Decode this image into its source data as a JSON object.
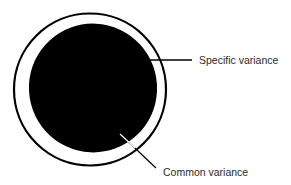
{
  "diagram": {
    "type": "variance-decomposition",
    "shapes": {
      "total_variance_circle": {
        "cx": 90,
        "cy": 89.5,
        "r": 76,
        "stroke": "#000000",
        "stroke_width": 2.2,
        "fill": "none"
      },
      "common_variance_ellipse": {
        "cx": 93,
        "cy": 88,
        "rx": 64,
        "ry": 64,
        "fill": "#000000"
      }
    },
    "labels": {
      "specific": "Specific variance",
      "common": "Common variance"
    },
    "leaders": {
      "specific": {
        "x1": 148,
        "y1": 60,
        "x2": 192,
        "y2": 60
      },
      "common": {
        "x1": 120,
        "y1": 134,
        "x2": 156,
        "y2": 168
      }
    },
    "colors": {
      "ink": "#000000",
      "text": "#2a2a2a",
      "background": "#ffffff"
    }
  }
}
